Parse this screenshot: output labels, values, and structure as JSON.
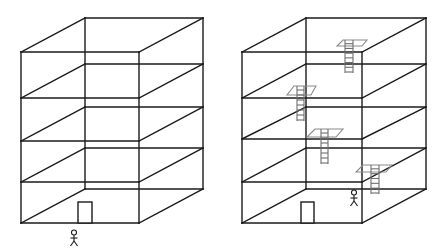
{
  "diagram": {
    "title": "",
    "colors": {
      "edge": "#1a1a1a",
      "hatch": "#8a8a8a",
      "ladder": "#6e6e6e",
      "background": "#ffffff"
    },
    "buildings": [
      {
        "id": "left",
        "label": "building without ladders",
        "floors": 4,
        "front": {
          "x1": 21,
          "x2": 139,
          "levels": [
            52,
            98,
            141,
            182,
            223
          ]
        },
        "back": {
          "x1": 85,
          "x2": 203,
          "levels": [
            18,
            64,
            107,
            148,
            189
          ]
        },
        "door": {
          "x": 78,
          "y": 202,
          "w": 14,
          "h": 21
        },
        "person": {
          "x": 74,
          "y": 230,
          "location": "outside, in front of door"
        },
        "ladders": []
      },
      {
        "id": "right",
        "label": "building with ladders between floors",
        "floors": 4,
        "front": {
          "x1": 242,
          "x2": 362,
          "levels": [
            52,
            98,
            139,
            182,
            223
          ]
        },
        "back": {
          "x1": 306,
          "x2": 426,
          "levels": [
            18,
            64,
            107,
            148,
            189
          ]
        },
        "door": {
          "x": 301,
          "y": 202,
          "w": 13,
          "h": 21
        },
        "person": {
          "x": 354,
          "y": 190,
          "location": "inside, ground floor"
        },
        "ladders": [
          {
            "hatch": [
              [
                337,
                46
              ],
              [
                362,
                46
              ],
              [
                367,
                40
              ],
              [
                343,
                40
              ]
            ],
            "x": 345,
            "w": 8,
            "y1": 40,
            "y2": 73,
            "rungs": 7
          },
          {
            "hatch": [
              [
                287,
                95
              ],
              [
                311,
                95
              ],
              [
                316,
                86
              ],
              [
                294,
                86
              ]
            ],
            "x": 297,
            "w": 7,
            "y1": 86,
            "y2": 121,
            "rungs": 7
          },
          {
            "hatch": [
              [
                307,
                137
              ],
              [
                336,
                137
              ],
              [
                343,
                129
              ],
              [
                315,
                129
              ]
            ],
            "x": 321,
            "w": 7,
            "y1": 129,
            "y2": 164,
            "rungs": 7
          },
          {
            "hatch": [
              [
                356,
                172
              ],
              [
                386,
                172
              ],
              [
                392,
                165
              ],
              [
                363,
                165
              ]
            ],
            "x": 371,
            "w": 8,
            "y1": 165,
            "y2": 194,
            "rungs": 6
          }
        ]
      }
    ]
  }
}
